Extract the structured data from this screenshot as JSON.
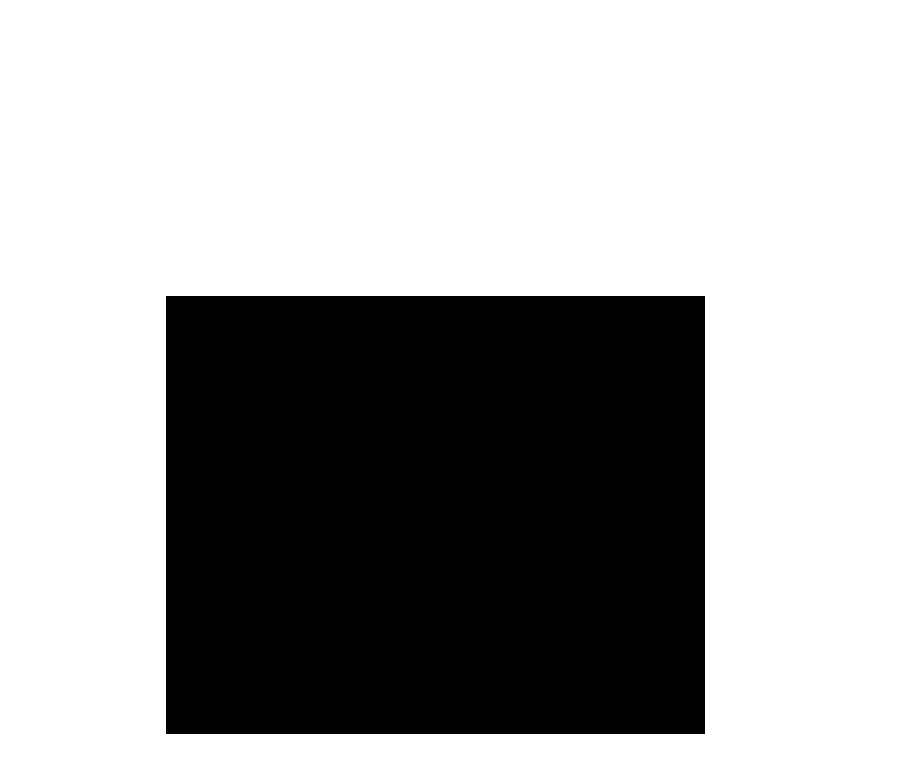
{
  "diagram": {
    "type": "nested-squares-on-grid",
    "colors": {
      "background": "#ffffff",
      "grid_line": "#555555",
      "region_B": "#a2a2a2",
      "region_A": "#545454",
      "diagonal": "#333333",
      "vertical_axis": "#444444"
    },
    "regions": [
      {
        "id": "C",
        "label": "C",
        "description": "entire grid area (outermost)"
      },
      {
        "id": "B",
        "label": "B",
        "description": "medium gray square"
      },
      {
        "id": "A",
        "label": "A",
        "description": "dark gray square"
      }
    ],
    "lines": [
      {
        "id": "diagonal",
        "description": "line from bottom center rising through top-right corners of A and B to top-right of C"
      },
      {
        "id": "center-vertical",
        "description": "vertical line through center of A and B"
      }
    ]
  }
}
